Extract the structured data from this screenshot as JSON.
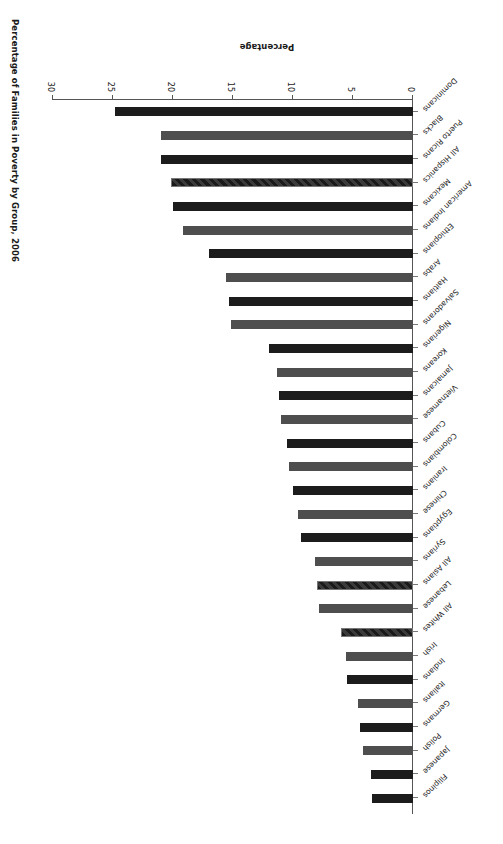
{
  "chart": {
    "title": "Percentage of Families in Poverty by Group, 2006",
    "value_axis_label": "Percentage"
  },
  "chart_data": {
    "type": "bar",
    "orientation": "horizontal",
    "title": "Percentage of Families in Poverty by Group, 2006",
    "xlabel": "Percentage",
    "ylabel": "",
    "xlim": [
      0,
      30
    ],
    "xticks": [
      0,
      5,
      10,
      15,
      20,
      25,
      30
    ],
    "grid": false,
    "legend": "none",
    "categories": [
      "Dominicans",
      "Blacks",
      "Puerto Ricans",
      "All Hispanics",
      "Mexicans",
      "American Indians",
      "Ethiopians",
      "Arabs",
      "Haitians",
      "Salvadorans",
      "Nigerians",
      "Koreans",
      "Jamaicans",
      "Vietnamese",
      "Cubans",
      "Colombians",
      "Iranians",
      "Chinese",
      "Egyptians",
      "Syrians",
      "All Asians",
      "Lebanese",
      "All Whites",
      "Irish",
      "Indians",
      "Italians",
      "Germans",
      "Polish",
      "Japanese",
      "Filipinos"
    ],
    "values": [
      24.8,
      21.0,
      21.0,
      20.2,
      20.0,
      19.2,
      17.0,
      15.6,
      15.3,
      15.2,
      12.0,
      11.3,
      11.2,
      11.0,
      10.5,
      10.3,
      10.0,
      9.6,
      9.3,
      8.2,
      8.0,
      7.8,
      6.0,
      5.6,
      5.5,
      4.6,
      4.4,
      4.2,
      3.5,
      3.4
    ],
    "bar_styles": [
      "dark",
      "gray",
      "dark",
      "hatch",
      "dark",
      "gray",
      "dark",
      "gray",
      "dark",
      "gray",
      "dark",
      "gray",
      "dark",
      "gray",
      "dark",
      "gray",
      "dark",
      "gray",
      "dark",
      "gray",
      "hatch",
      "gray",
      "hatch",
      "gray",
      "dark",
      "gray",
      "dark",
      "gray",
      "dark",
      "dark"
    ],
    "colors": {
      "dark": "#1c1c1c",
      "gray": "#4e4e4e",
      "hatch": "#3a3a3a",
      "axis": "#555555",
      "text": "#1a1a1a",
      "background": "#ffffff"
    }
  }
}
